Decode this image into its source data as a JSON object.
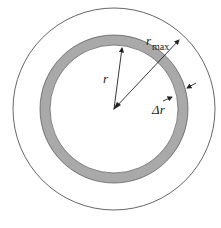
{
  "diagram": {
    "labels": {
      "r": "r",
      "rmax_main": "r",
      "rmax_sub": "max",
      "delta_r": "Δr"
    },
    "colors": {
      "ring_fill": "#a9a9a9",
      "ring_stroke": "#555555",
      "outer_circle": "#555555",
      "arrow": "#222222",
      "background": "#ffffff"
    },
    "geometry": {
      "center": [
        114,
        109
      ],
      "outer_radius": 101,
      "ring_outer_radius": 74,
      "ring_inner_radius": 64
    }
  }
}
